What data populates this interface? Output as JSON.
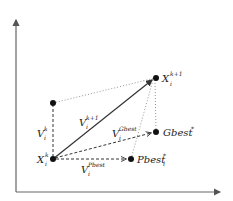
{
  "diagram": {
    "type": "pso-velocity-update",
    "colors": {
      "axis": "#555555",
      "line": "#333333",
      "point": "#111111",
      "background": "#ffffff"
    },
    "points": {
      "x_current": {
        "label": "X",
        "sub": "i",
        "sup": "k"
      },
      "x_next": {
        "label": "X",
        "sub": "i",
        "sup": "k+1"
      },
      "v_prev_tip": {
        "label": ""
      },
      "gbest": {
        "label": "Gbest",
        "sup": "*"
      },
      "pbest": {
        "label": "Pbest",
        "sub": "i",
        "sup": "*"
      }
    },
    "vectors": {
      "v_k": {
        "label": "V",
        "sub": "i",
        "sup": "k"
      },
      "v_next": {
        "label": "V",
        "sub": "i",
        "sup": "k+1"
      },
      "v_gbest": {
        "label": "V",
        "sub": "i",
        "sup": "Gbest"
      },
      "v_pbest": {
        "label": "V",
        "sub": "i",
        "sup": "Pbest"
      }
    }
  }
}
